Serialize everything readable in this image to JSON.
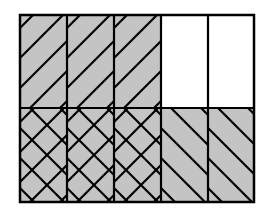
{
  "diagram": {
    "columns": 5,
    "rows": 2,
    "fill_color": "#c4c4c4",
    "empty_color": "#ffffff",
    "line_color": "#000000",
    "cells": [
      {
        "row": 0,
        "col": 0,
        "fill": "shaded",
        "hatch": "forward"
      },
      {
        "row": 0,
        "col": 1,
        "fill": "shaded",
        "hatch": "forward"
      },
      {
        "row": 0,
        "col": 2,
        "fill": "shaded",
        "hatch": "forward"
      },
      {
        "row": 0,
        "col": 3,
        "fill": "empty",
        "hatch": "none"
      },
      {
        "row": 0,
        "col": 4,
        "fill": "empty",
        "hatch": "none"
      },
      {
        "row": 1,
        "col": 0,
        "fill": "shaded",
        "hatch": "cross"
      },
      {
        "row": 1,
        "col": 1,
        "fill": "shaded",
        "hatch": "cross"
      },
      {
        "row": 1,
        "col": 2,
        "fill": "shaded",
        "hatch": "cross"
      },
      {
        "row": 1,
        "col": 3,
        "fill": "shaded",
        "hatch": "back"
      },
      {
        "row": 1,
        "col": 4,
        "fill": "shaded",
        "hatch": "back"
      }
    ]
  }
}
